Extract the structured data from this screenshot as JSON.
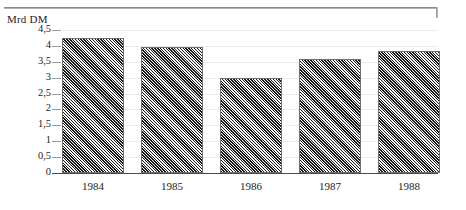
{
  "figure": {
    "top_rule": "horizontal-rule",
    "axis_caption": "Mrd DM"
  },
  "chart_data": {
    "type": "bar",
    "title": "",
    "subtitle": "",
    "xlabel": "",
    "ylabel": "Mrd DM",
    "categories": [
      "1984",
      "1985",
      "1986",
      "1987",
      "1988"
    ],
    "values": [
      4.25,
      3.95,
      3.0,
      3.6,
      3.85
    ],
    "series": [
      {
        "name": "Mrd DM",
        "values": [
          4.25,
          3.95,
          3.0,
          3.6,
          3.85
        ]
      }
    ],
    "ylim": [
      0,
      4.5
    ],
    "ytick_values": [
      0,
      0.5,
      1,
      1.5,
      2,
      2.5,
      3,
      3.5,
      4,
      4.5
    ],
    "ytick_labels": [
      "0",
      "0,5",
      "1",
      "1,5",
      "2",
      "2,5",
      "3",
      "3,5",
      "4",
      "4,5"
    ],
    "xtick_labels": [
      "1984",
      "1985",
      "1986",
      "1987",
      "1988"
    ],
    "grid": true,
    "grid_axis": "y",
    "legend": false,
    "legend_position": "none",
    "decimal_separator": ",",
    "bar_fill": "diagonal-hatch",
    "colors": {
      "bar_fill": "#8e8e8e",
      "bar_border": "#6f6f6f",
      "gridline": "#ececec",
      "axis": "#4a4a4a",
      "text": "#242424"
    }
  }
}
